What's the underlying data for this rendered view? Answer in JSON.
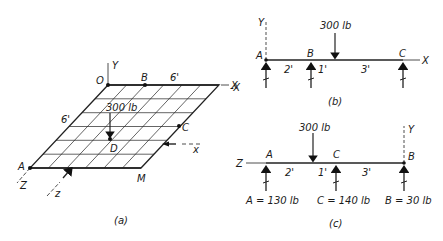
{
  "figure_a": {
    "caption": "(a)",
    "points": {
      "O": "O",
      "B": "B",
      "C": "C",
      "D": "D",
      "A": "A",
      "M": "M"
    },
    "axes": {
      "Y": "Y",
      "X": "X",
      "Z": "Z",
      "x_section": "x",
      "z_section": "z"
    },
    "dimensions": {
      "top": "6'",
      "left": "6'"
    },
    "load": "300 lb",
    "grid_divisions": 6
  },
  "figure_b": {
    "caption": "(b)",
    "axes": {
      "Y": "Y",
      "X": "X",
      "neg_X": "-X"
    },
    "supports": [
      "A",
      "B",
      "C"
    ],
    "spans": [
      "2'",
      "1'",
      "3'"
    ],
    "load": "300 lb"
  },
  "figure_c": {
    "caption": "(c)",
    "axes": {
      "Y": "Y",
      "Z": "Z"
    },
    "supports": [
      "A",
      "C",
      "B"
    ],
    "spans": [
      "2'",
      "1'",
      "3'"
    ],
    "load": "300 lb",
    "reactions": [
      "A = 130 lb",
      "C = 140 lb",
      "B = 30 lb"
    ]
  }
}
